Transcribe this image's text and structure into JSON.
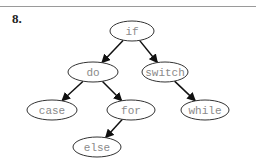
{
  "question": {
    "label": "8."
  },
  "tree": {
    "nodes": [
      {
        "id": "if",
        "label": "if",
        "cx": 132,
        "cy": 31,
        "rx": 22,
        "ry": 10
      },
      {
        "id": "do",
        "label": "do",
        "cx": 93,
        "cy": 72,
        "rx": 25,
        "ry": 10
      },
      {
        "id": "switch",
        "label": "switch",
        "cx": 165,
        "cy": 72,
        "rx": 23,
        "ry": 10
      },
      {
        "id": "case",
        "label": "case",
        "cx": 52,
        "cy": 110,
        "rx": 25,
        "ry": 10
      },
      {
        "id": "for",
        "label": "for",
        "cx": 131,
        "cy": 110,
        "rx": 24,
        "ry": 10
      },
      {
        "id": "while",
        "label": "while",
        "cx": 205,
        "cy": 110,
        "rx": 24,
        "ry": 10
      },
      {
        "id": "else",
        "label": "else",
        "cx": 97,
        "cy": 147,
        "rx": 24,
        "ry": 10
      }
    ],
    "edges": [
      {
        "from": "if",
        "to": "do"
      },
      {
        "from": "if",
        "to": "switch"
      },
      {
        "from": "do",
        "to": "case"
      },
      {
        "from": "do",
        "to": "for"
      },
      {
        "from": "switch",
        "to": "while"
      },
      {
        "from": "for",
        "to": "else"
      }
    ]
  }
}
